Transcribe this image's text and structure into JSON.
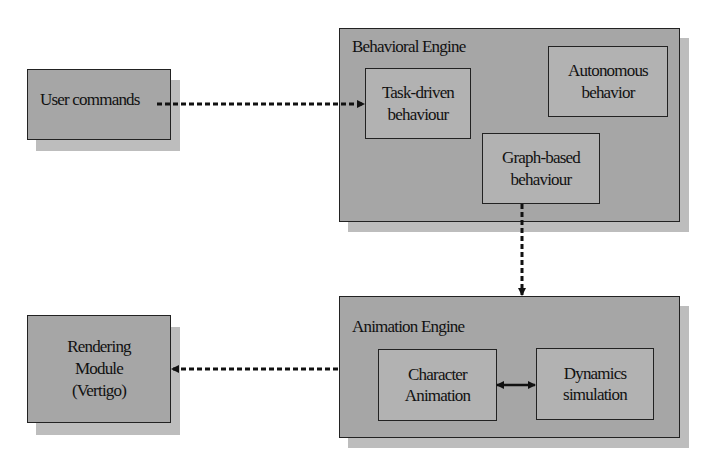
{
  "colors": {
    "box_fill": "#a6a6a6",
    "inner_fill": "#b2b2b2",
    "shadow": "#bdbdbd",
    "border": "#222222",
    "background": "#ffffff"
  },
  "nodes": {
    "user_commands": {
      "label": "User commands"
    },
    "behavioral_engine": {
      "title": "Behavioral Engine",
      "task_driven": {
        "line1": "Task-driven",
        "line2": "behaviour"
      },
      "autonomous": {
        "line1": "Autonomous",
        "line2": "behavior"
      },
      "graph_based": {
        "line1": "Graph-based",
        "line2": "behaviour"
      }
    },
    "animation_engine": {
      "title": "Animation Engine",
      "character_animation": {
        "line1": "Character",
        "line2": "Animation"
      },
      "dynamics_simulation": {
        "line1": "Dynamics",
        "line2": "simulation"
      }
    },
    "rendering_module": {
      "line1": "Rendering",
      "line2": "Module",
      "line3": "(Vertigo)"
    }
  },
  "edges": [
    {
      "from": "User commands",
      "to": "Task-driven behaviour",
      "style": "dashed",
      "direction": "forward"
    },
    {
      "from": "Graph-based behaviour",
      "to": "Animation Engine",
      "style": "dashed",
      "direction": "forward"
    },
    {
      "from": "Animation Engine",
      "to": "Rendering Module (Vertigo)",
      "style": "dashed",
      "direction": "forward"
    },
    {
      "from": "Character Animation",
      "to": "Dynamics simulation",
      "style": "solid",
      "direction": "bidirectional"
    }
  ]
}
